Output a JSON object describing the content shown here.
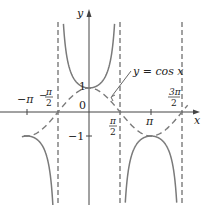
{
  "chart_data": {
    "type": "line",
    "title": "",
    "xlabel": "x",
    "ylabel": "y",
    "annotation": "y = cos x",
    "series": [
      {
        "name": "y = sec x",
        "style": "solid",
        "color": "#7a7a7a"
      },
      {
        "name": "y = cos x",
        "style": "dashed",
        "color": "#7a7a7a"
      }
    ],
    "asymptotes": [
      "-π/2",
      "π/2",
      "3π/2"
    ],
    "x_ticks": [
      "−π",
      "−π/2",
      "π/2",
      "π",
      "3π/2"
    ],
    "y_ticks": [
      "1",
      "−1"
    ],
    "origin_label": "0",
    "xlim": [
      -3.5,
      5.2
    ],
    "ylim": [
      -3.9,
      4.6
    ],
    "grid": false,
    "legend": "none"
  },
  "labels": {
    "y_axis": "y",
    "x_axis": "x",
    "origin": "0",
    "one": "1",
    "neg_one": "−1",
    "neg_pi": "−π",
    "neg_pi_half_num": "π",
    "neg_pi_half_den": "2",
    "neg_sign": "−",
    "pi_half_num": "π",
    "pi_half_den": "2",
    "pi": "π",
    "three_pi_half_num": "3π",
    "three_pi_half_den": "2",
    "annotation": "y = cos x"
  }
}
